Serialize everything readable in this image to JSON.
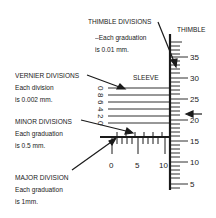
{
  "labels": {
    "thimble_divisions": {
      "title": "THIMBLE DIVISIONS",
      "line1": "–Each graduation",
      "line2": "is 0.01 mm."
    },
    "thimble": "THIMBLE",
    "sleeve": "SLEEVE",
    "vernier_divisions": {
      "title": "VERNIER DIVISIONS",
      "line1": "Each division",
      "line2": "is 0.002 mm."
    },
    "minor_divisions": {
      "title": "MINOR DIVISIONS",
      "line1": "Each graduation",
      "line2": "is 0.5 mm."
    },
    "major_division": {
      "title": "MAJOR DIVISION",
      "line1": "Each graduation",
      "line2": "is 1mm."
    }
  },
  "thimble_scale": [
    "35",
    "30",
    "25",
    "20",
    "15",
    "10",
    "5"
  ],
  "sleeve_scale": [
    "0",
    "5",
    "10"
  ],
  "vernier_scale": [
    "0",
    "2",
    "4",
    "6",
    "8",
    "0"
  ],
  "colors": {
    "ink": "#1a1a1a",
    "background": "#ffffff"
  }
}
